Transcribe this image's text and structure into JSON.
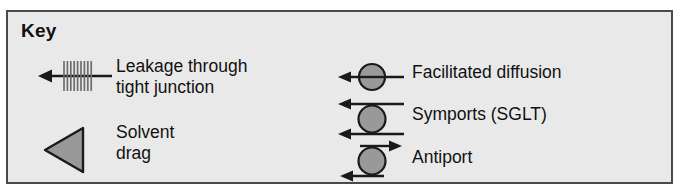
{
  "key_box": {
    "title": "Key",
    "background_color": "#e9e9e9",
    "border_color": "#4a4a4a",
    "symbol_fill_color": "#999999",
    "symbol_stroke_color": "#1a1a1a"
  },
  "legend": {
    "left_column": [
      {
        "id": "leakage",
        "label": "Leakage through\ntight junction",
        "icon": "hatched-left-arrow-icon"
      },
      {
        "id": "solvent-drag",
        "label": "Solvent\ndrag",
        "icon": "left-triangle-icon"
      }
    ],
    "right_column": [
      {
        "id": "facilitated-diffusion",
        "label": "Facilitated diffusion",
        "icon": "circle-with-left-arrow-icon"
      },
      {
        "id": "symports",
        "label": "Symports (SGLT)",
        "icon": "circle-with-two-left-arrows-icon"
      },
      {
        "id": "antiport",
        "label": "Antiport",
        "icon": "circle-with-opposing-arrows-icon"
      }
    ]
  }
}
